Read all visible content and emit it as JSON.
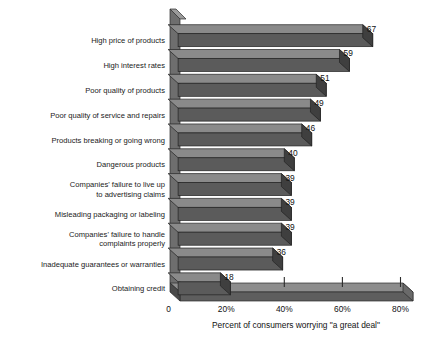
{
  "chart_data": {
    "type": "bar",
    "orientation": "horizontal",
    "title": "",
    "xlabel": "Percent of consumers worrying \"a great deal\"",
    "ylabel": "",
    "xlim": [
      0,
      90
    ],
    "grid": false,
    "legend": null,
    "categories": [
      "High price of products",
      "High interest rates",
      "Poor quality of products",
      "Poor quality of service and repairs",
      "Products breaking or going wrong",
      "Dangerous products",
      "Companies' failure to live up\nto advertising claims",
      "Misleading packaging or labeling",
      "Companies' failure to handle\ncomplaints properly",
      "Inadequate guarantees or warranties",
      "Obtaining credit"
    ],
    "values": [
      67,
      59,
      51,
      49,
      46,
      40,
      39,
      39,
      39,
      36,
      18
    ],
    "value_labels": [
      "67",
      "59",
      "51",
      "49",
      "46",
      "40",
      "39",
      "39",
      "39",
      "36",
      "18"
    ],
    "xticks": [
      0,
      20,
      40,
      60,
      80
    ],
    "xtick_labels": [
      "0",
      "20%",
      "40%",
      "60%",
      "80%"
    ],
    "colors": {
      "bar_face": "#5b5b5b",
      "bar_top": "#8a8a8a",
      "bar_side": "#3f3f3f",
      "axis_wall": "#6e6e6e",
      "floor": "#5e5e5e",
      "background": "#ffffff",
      "text": "#111111"
    }
  },
  "category_lines": [
    [
      "High price of products"
    ],
    [
      "High interest rates"
    ],
    [
      "Poor quality of products"
    ],
    [
      "Poor quality of service and repairs"
    ],
    [
      "Products breaking or going wrong"
    ],
    [
      "Dangerous products"
    ],
    [
      "Companies' failure to live up",
      "to advertising claims"
    ],
    [
      "Misleading packaging or labeling"
    ],
    [
      "Companies' failure to handle",
      "complaints properly"
    ],
    [
      "Inadequate guarantees or warranties"
    ],
    [
      "Obtaining credit"
    ]
  ]
}
